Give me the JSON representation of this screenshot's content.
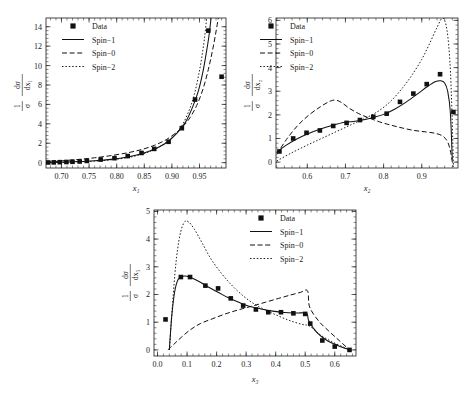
{
  "figure": {
    "background": "#ffffff",
    "ink": "#111111",
    "panels": [
      "panel-x1",
      "panel-x2",
      "panel-x3"
    ]
  },
  "legend": {
    "entries": [
      {
        "key": "data",
        "label": "Data",
        "marker": "filled-square"
      },
      {
        "key": "spin1",
        "label": "Spin−1",
        "marker": "solid-line"
      },
      {
        "key": "spin0",
        "label": "Spin−0",
        "marker": "dashed-line"
      },
      {
        "key": "spin2",
        "label": "Spin−2",
        "marker": "dotted-line"
      }
    ]
  },
  "ylabel_parts": {
    "num_left": "1",
    "den_left": "σ",
    "num_right_1": "dσ",
    "den_right_1": "dx₁",
    "num_right_2": "dσ",
    "den_right_2": "dx₂",
    "num_right_3": "dσ",
    "den_right_3": "dx₃"
  },
  "chart_data": [
    {
      "id": "panel-x1",
      "type": "scatter",
      "title": "",
      "xlabel": "x₁",
      "ylabel": "1/σ dσ/dx₁",
      "xlim": [
        0.672,
        0.998
      ],
      "ylim": [
        -0.55,
        14.9
      ],
      "xticks": [
        0.7,
        0.75,
        0.8,
        0.85,
        0.9,
        0.95
      ],
      "xticklabels": [
        "0.70",
        "0.75",
        "0.80",
        "0.85",
        "0.90",
        "0.95"
      ],
      "yticks": [
        0,
        2,
        4,
        6,
        8,
        10,
        12,
        14
      ],
      "yticklabels": [
        "0",
        "2",
        "4",
        "6",
        "8",
        "10",
        "12",
        "14"
      ],
      "grid": false,
      "legend_position": "top-left",
      "series": [
        {
          "name": "Data",
          "style": "points",
          "x": [
            0.676,
            0.686,
            0.697,
            0.709,
            0.72,
            0.733,
            0.746,
            0.771,
            0.796,
            0.82,
            0.845,
            0.868,
            0.894,
            0.918,
            0.942,
            0.966,
            0.99
          ],
          "y": [
            0.02,
            0.03,
            0.05,
            0.07,
            0.09,
            0.12,
            0.18,
            0.32,
            0.46,
            0.68,
            1.0,
            1.42,
            2.15,
            3.55,
            6.5,
            13.6,
            8.85
          ]
        },
        {
          "name": "Spin−1",
          "style": "solid",
          "x": [
            0.672,
            0.7,
            0.73,
            0.76,
            0.79,
            0.82,
            0.845,
            0.868,
            0.89,
            0.91,
            0.925,
            0.938,
            0.948,
            0.956,
            0.962,
            0.967,
            0.971
          ],
          "y": [
            0.01,
            0.05,
            0.11,
            0.2,
            0.34,
            0.58,
            0.92,
            1.38,
            2.05,
            3.1,
            4.2,
            5.8,
            7.4,
            9.3,
            11.2,
            13.0,
            14.9
          ]
        },
        {
          "name": "Spin−0",
          "style": "dashed",
          "x": [
            0.672,
            0.7,
            0.73,
            0.76,
            0.79,
            0.82,
            0.845,
            0.868,
            0.89,
            0.912,
            0.93,
            0.945,
            0.957,
            0.966,
            0.973,
            0.979,
            0.984
          ],
          "y": [
            0.05,
            0.18,
            0.33,
            0.5,
            0.73,
            1.02,
            1.35,
            1.78,
            2.38,
            3.3,
            4.4,
            5.9,
            7.7,
            9.6,
            11.4,
            13.2,
            14.9
          ]
        },
        {
          "name": "Spin−2",
          "style": "dotted",
          "x": [
            0.672,
            0.7,
            0.73,
            0.76,
            0.79,
            0.82,
            0.845,
            0.868,
            0.89,
            0.908,
            0.92,
            0.932,
            0.941,
            0.948,
            0.954,
            0.959,
            0.963
          ],
          "y": [
            0.0,
            0.03,
            0.08,
            0.16,
            0.29,
            0.52,
            0.86,
            1.35,
            2.1,
            3.05,
            4.0,
            5.5,
            7.1,
            8.9,
            10.8,
            12.8,
            14.9
          ]
        }
      ]
    },
    {
      "id": "panel-x2",
      "type": "scatter",
      "title": "",
      "xlabel": "x₂",
      "ylabel": "1/σ dσ/dx₂",
      "xlim": [
        0.518,
        0.995
      ],
      "ylim": [
        -0.25,
        6.1
      ],
      "xticks": [
        0.6,
        0.7,
        0.8,
        0.9
      ],
      "xticklabels": [
        "0.6",
        "0.7",
        "0.8",
        "0.9"
      ],
      "yticks": [
        0,
        1,
        2,
        3,
        4,
        5,
        6
      ],
      "yticklabels": [
        "0",
        "1",
        "2",
        "3",
        "4",
        "5",
        "6"
      ],
      "grid": false,
      "legend_position": "top-left",
      "series": [
        {
          "name": "Data",
          "style": "points",
          "x": [
            0.527,
            0.563,
            0.598,
            0.633,
            0.668,
            0.703,
            0.738,
            0.773,
            0.808,
            0.843,
            0.878,
            0.913,
            0.948,
            0.983
          ],
          "y": [
            0.45,
            1.0,
            1.24,
            1.34,
            1.53,
            1.66,
            1.78,
            1.92,
            2.05,
            2.55,
            2.9,
            3.3,
            3.72,
            2.12
          ]
        },
        {
          "name": "Spin−1",
          "style": "solid",
          "x": [
            0.52,
            0.545,
            0.575,
            0.605,
            0.635,
            0.665,
            0.695,
            0.72,
            0.745,
            0.77,
            0.8,
            0.83,
            0.86,
            0.89,
            0.915,
            0.935,
            0.95,
            0.96,
            0.968,
            0.975,
            0.98
          ],
          "y": [
            0.42,
            0.72,
            1.0,
            1.22,
            1.4,
            1.55,
            1.68,
            1.72,
            1.78,
            1.88,
            2.02,
            2.25,
            2.55,
            2.9,
            3.2,
            3.4,
            3.44,
            3.35,
            3.0,
            2.1,
            0.1
          ]
        },
        {
          "name": "Spin−0",
          "style": "dashed",
          "x": [
            0.52,
            0.545,
            0.575,
            0.605,
            0.635,
            0.66,
            0.675,
            0.69,
            0.71,
            0.735,
            0.76,
            0.79,
            0.82,
            0.85,
            0.88,
            0.91,
            0.935,
            0.955,
            0.968,
            0.976,
            0.982
          ],
          "y": [
            0.32,
            0.95,
            1.55,
            2.0,
            2.35,
            2.58,
            2.62,
            2.52,
            2.28,
            2.05,
            1.88,
            1.7,
            1.56,
            1.44,
            1.34,
            1.28,
            1.22,
            1.1,
            0.85,
            0.4,
            -0.2
          ]
        },
        {
          "name": "Spin−2",
          "style": "dotted",
          "x": [
            0.52,
            0.56,
            0.6,
            0.64,
            0.68,
            0.72,
            0.76,
            0.79,
            0.82,
            0.85,
            0.875,
            0.9,
            0.92,
            0.94,
            0.955,
            0.966,
            0.974,
            0.979,
            0.983
          ],
          "y": [
            0.05,
            0.4,
            0.72,
            1.02,
            1.32,
            1.62,
            1.92,
            2.2,
            2.6,
            3.15,
            3.7,
            4.35,
            5.0,
            5.7,
            6.1,
            5.6,
            4.2,
            2.2,
            -0.2
          ]
        }
      ]
    },
    {
      "id": "panel-x3",
      "type": "scatter",
      "title": "",
      "xlabel": "x₃",
      "ylabel": "1/σ dσ/dx₃",
      "xlim": [
        -0.012,
        0.672
      ],
      "ylim": [
        -0.22,
        5.05
      ],
      "xticks": [
        0.0,
        0.1,
        0.2,
        0.3,
        0.4,
        0.5,
        0.6
      ],
      "xticklabels": [
        "0.0",
        "0.1",
        "0.2",
        "0.3",
        "0.4",
        "0.5",
        "0.6"
      ],
      "yticks": [
        0,
        1,
        2,
        3,
        4,
        5
      ],
      "yticklabels": [
        "0",
        "1",
        "2",
        "3",
        "4",
        "5"
      ],
      "grid": false,
      "legend_position": "top-right",
      "series": [
        {
          "name": "Data",
          "style": "points",
          "x": [
            0.027,
            0.079,
            0.11,
            0.162,
            0.205,
            0.248,
            0.29,
            0.333,
            0.375,
            0.418,
            0.46,
            0.5,
            0.517,
            0.558,
            0.6,
            0.65
          ],
          "y": [
            1.1,
            2.63,
            2.63,
            2.32,
            2.22,
            1.86,
            1.6,
            1.46,
            1.36,
            1.36,
            1.32,
            1.3,
            0.95,
            0.34,
            0.12,
            0.0
          ]
        },
        {
          "name": "Spin−1",
          "style": "solid",
          "x": [
            0.04,
            0.048,
            0.058,
            0.07,
            0.085,
            0.1,
            0.12,
            0.145,
            0.175,
            0.205,
            0.24,
            0.275,
            0.31,
            0.35,
            0.39,
            0.43,
            0.47,
            0.505,
            0.512,
            0.54,
            0.575,
            0.61,
            0.65
          ],
          "y": [
            0.0,
            1.2,
            2.1,
            2.55,
            2.66,
            2.66,
            2.58,
            2.44,
            2.25,
            2.08,
            1.88,
            1.72,
            1.58,
            1.48,
            1.4,
            1.35,
            1.33,
            1.32,
            1.05,
            0.62,
            0.33,
            0.16,
            0.0
          ]
        },
        {
          "name": "Spin−0",
          "style": "dashed",
          "x": [
            0.035,
            0.055,
            0.08,
            0.11,
            0.145,
            0.185,
            0.23,
            0.275,
            0.32,
            0.365,
            0.41,
            0.45,
            0.485,
            0.508,
            0.515,
            0.545,
            0.58,
            0.615,
            0.65
          ],
          "y": [
            0.0,
            0.2,
            0.45,
            0.72,
            0.95,
            1.12,
            1.3,
            1.45,
            1.58,
            1.72,
            1.86,
            1.98,
            2.08,
            2.13,
            1.55,
            1.05,
            0.68,
            0.34,
            0.0
          ]
        },
        {
          "name": "Spin−2",
          "style": "dotted",
          "x": [
            0.04,
            0.05,
            0.062,
            0.075,
            0.09,
            0.105,
            0.125,
            0.15,
            0.18,
            0.215,
            0.25,
            0.29,
            0.33,
            0.37,
            0.41,
            0.45,
            0.49,
            0.515,
            0.55,
            0.59,
            0.63,
            0.655
          ],
          "y": [
            0.0,
            1.55,
            3.1,
            4.1,
            4.6,
            4.62,
            4.35,
            3.88,
            3.3,
            2.78,
            2.35,
            1.95,
            1.64,
            1.42,
            1.22,
            1.05,
            0.92,
            0.86,
            0.55,
            0.3,
            0.1,
            0.0
          ]
        }
      ]
    }
  ]
}
